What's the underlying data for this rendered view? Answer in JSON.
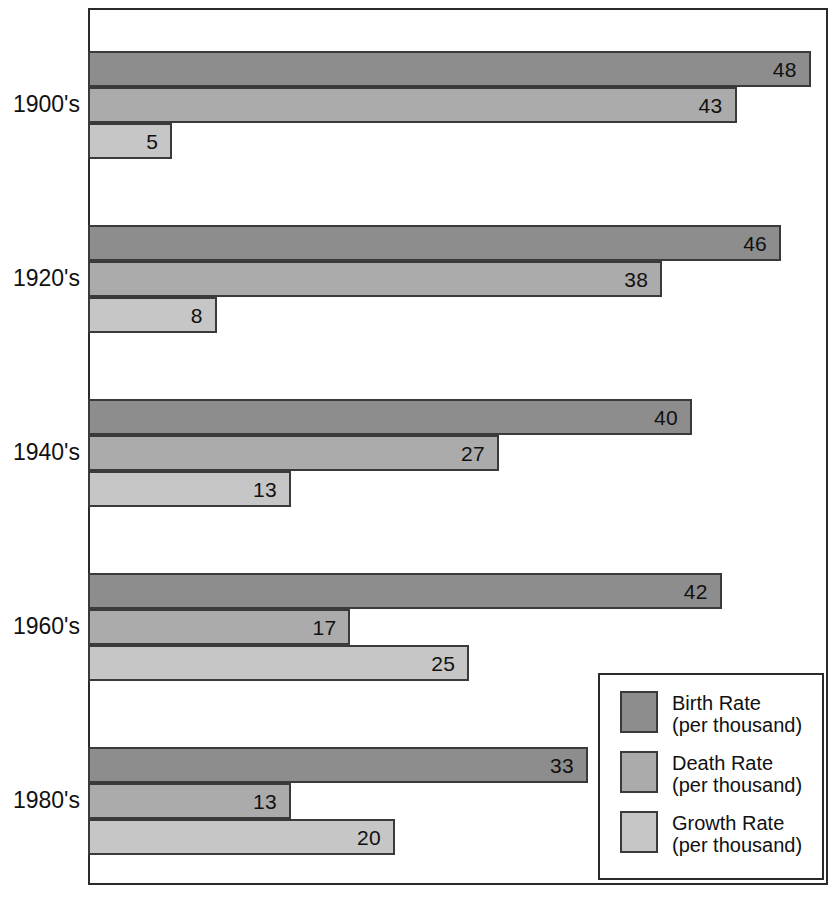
{
  "chart_data": {
    "type": "bar",
    "orientation": "horizontal",
    "title": "",
    "subtitle": "",
    "xlabel": "",
    "ylabel": "",
    "grid": false,
    "xlim": [
      0,
      48
    ],
    "legend_position": "bottom-right",
    "categories": [
      "1900's",
      "1920's",
      "1940's",
      "1960's",
      "1980's"
    ],
    "series": [
      {
        "name": "Birth Rate",
        "unit": "(per thousand)",
        "color": "#8d8d8d",
        "values": [
          48,
          46,
          40,
          42,
          33
        ]
      },
      {
        "name": "Death Rate",
        "unit": "(per thousand)",
        "color": "#ababab",
        "values": [
          43,
          38,
          27,
          17,
          13
        ]
      },
      {
        "name": "Growth Rate",
        "unit": "(per thousand)",
        "color": "#c6c6c6",
        "values": [
          5,
          8,
          13,
          25,
          20
        ]
      }
    ]
  },
  "legend": {
    "items": [
      {
        "name": "Birth Rate",
        "sub": "(per thousand)"
      },
      {
        "name": "Death Rate",
        "sub": "(per thousand)"
      },
      {
        "name": "Growth Rate",
        "sub": "(per thousand)"
      }
    ]
  },
  "colors": {
    "birth_rate": "#8d8d8d",
    "death_rate": "#ababab",
    "growth_rate": "#c6c6c6",
    "outline": "#2b2b2b",
    "background": "#ffffff"
  }
}
